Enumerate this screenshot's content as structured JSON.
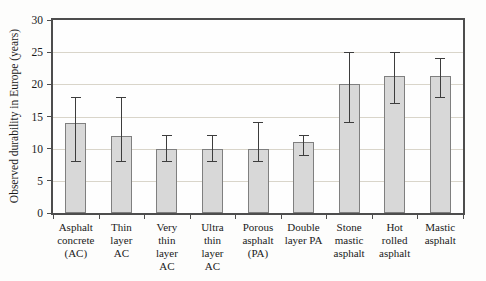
{
  "figure": {
    "background_color": "#fdfdfc",
    "text_color": "#1a1a1a"
  },
  "chart_data": {
    "type": "bar",
    "title": "",
    "xlabel": "",
    "ylabel": "Observed durability in Europe (years)",
    "ylim": [
      0,
      30
    ],
    "yticks": [
      0,
      5,
      10,
      15,
      20,
      25,
      30
    ],
    "grid": true,
    "legend": false,
    "categories": [
      "Asphalt concrete (AC)",
      "Thin layer AC",
      "Very thin layer AC",
      "Ultra thin layer AC",
      "Porous asphalt (PA)",
      "Double layer PA",
      "Stone mastic asphalt",
      "Hot rolled asphalt",
      "Mastic asphalt"
    ],
    "categories_lines": [
      [
        "Asphalt",
        "concrete",
        "(AC)"
      ],
      [
        "Thin",
        "layer",
        "AC"
      ],
      [
        "Very",
        "thin",
        "layer",
        "AC"
      ],
      [
        "Ultra",
        "thin",
        "layer",
        "AC"
      ],
      [
        "Porous",
        "asphalt",
        "(PA)"
      ],
      [
        "Double",
        "layer PA"
      ],
      [
        "Stone",
        "mastic",
        "asphalt"
      ],
      [
        "Hot",
        "rolled",
        "asphalt"
      ],
      [
        "Mastic",
        "asphalt"
      ]
    ],
    "values": [
      14,
      12,
      10,
      10,
      10,
      11,
      20,
      21.3,
      21.3
    ],
    "error_low": [
      8,
      8,
      8,
      8,
      8,
      9,
      14,
      17,
      18
    ],
    "error_high": [
      18,
      18,
      12,
      12,
      14,
      12,
      25,
      25,
      24
    ],
    "bar_fill": "#d8d8d8",
    "bar_border": "#7f7f7f",
    "errorbar_color": "#3d3d3d",
    "gridline_color": "#d9d5ca",
    "plot_border_color": "#4d4d4d"
  }
}
